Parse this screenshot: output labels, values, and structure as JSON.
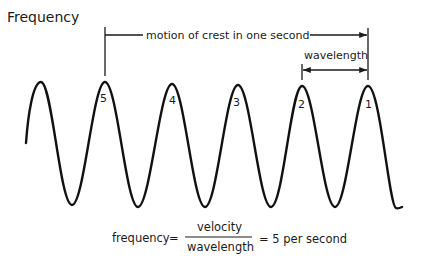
{
  "title": "Frequency",
  "annotations": {
    "motion": "motion of crest in one second",
    "wavelength": "wavelength"
  },
  "crest_labels": [
    "5",
    "4",
    "3",
    "2",
    "1"
  ],
  "formula": {
    "lhs": "frequency",
    "equals": "=",
    "numerator": "velocity",
    "denominator": "wavelength",
    "result": "= 5 per second"
  },
  "colors": {
    "ink": "#1a1a1a",
    "background": "#ffffff"
  }
}
